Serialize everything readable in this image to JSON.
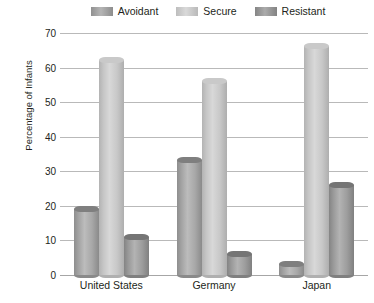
{
  "chart_data": {
    "type": "bar",
    "title": "",
    "subtitle": "",
    "xlabel": "",
    "ylabel": "Percentage of Infants",
    "categories": [
      "United States",
      "Germany",
      "Japan"
    ],
    "series": [
      {
        "name": "Avoidant",
        "color": "#a8a8a8",
        "values": [
          20,
          34,
          4
        ]
      },
      {
        "name": "Secure",
        "color": "#d2d2d2",
        "values": [
          63,
          57,
          67
        ]
      },
      {
        "name": "Resistant",
        "color": "#9b9b9b",
        "values": [
          12,
          7,
          27
        ]
      }
    ],
    "ylim": [
      0,
      70
    ],
    "yticks": [
      0,
      10,
      20,
      30,
      40,
      50,
      60,
      70
    ],
    "ytick_labels": [
      "0",
      "10",
      "20",
      "30",
      "40",
      "50",
      "60",
      "70"
    ],
    "grid": true,
    "grid_orientation": "horizontal",
    "legend": true,
    "legend_position": "top",
    "legend_entries": [
      "Avoidant",
      "Secure",
      "Resistant"
    ],
    "bar_style": "3d-cylinder",
    "annotations": []
  }
}
